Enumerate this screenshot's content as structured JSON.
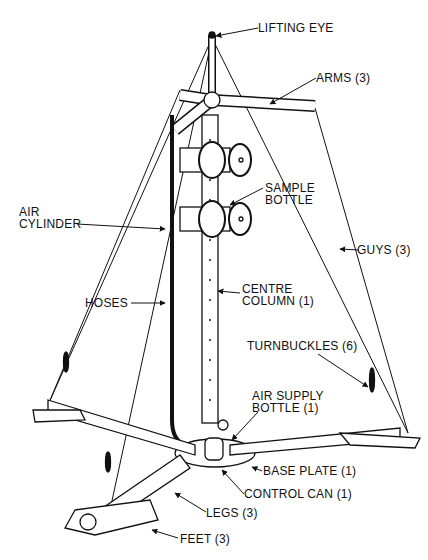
{
  "labels": {
    "lifting_eye": "LIFTING EYE",
    "arms": "ARMS (3)",
    "sample_bottle_1": "SAMPLE",
    "sample_bottle_2": "BOTTLE",
    "air_cylinder_1": "AIR",
    "air_cylinder_2": "CYLINDER",
    "guys": "GUYS (3)",
    "centre_column_1": "CENTRE",
    "centre_column_2": "COLUMN (1)",
    "hoses": "HOSES",
    "turnbuckles": "TURNBUCKLES (6)",
    "air_supply_1": "AIR SUPPLY",
    "air_supply_2": "BOTTLE (1)",
    "base_plate": "BASE PLATE (1)",
    "control_can": "CONTROL CAN (1)",
    "legs": "LEGS (3)",
    "feet": "FEET (3)"
  }
}
